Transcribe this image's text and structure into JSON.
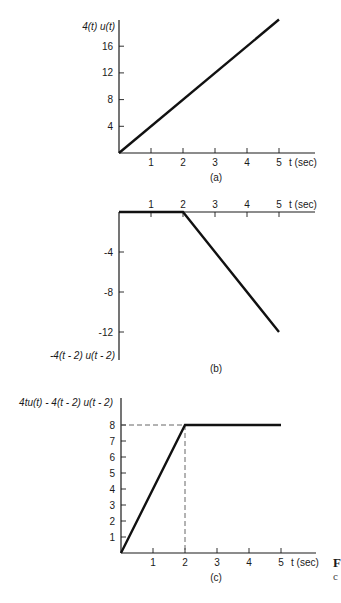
{
  "chart_data": [
    {
      "type": "line",
      "caption": "(a)",
      "ylabel": "4(t) u(t)",
      "xlabel": "t (sec)",
      "x_ticks": [
        "1",
        "2",
        "3",
        "4",
        "5"
      ],
      "y_ticks": [
        "4",
        "8",
        "12",
        "16"
      ],
      "y_tick_values": [
        4,
        8,
        12,
        16
      ],
      "xlim": [
        0,
        5
      ],
      "ylim": [
        0,
        20
      ],
      "series": [
        {
          "name": "4t u(t)",
          "x": [
            0,
            5
          ],
          "y": [
            0,
            20
          ]
        }
      ],
      "grid": false
    },
    {
      "type": "line",
      "caption": "(b)",
      "ylabel": "-4(t - 2) u(t - 2)",
      "xlabel": "t (sec)",
      "x_ticks": [
        "1",
        "2",
        "3",
        "4",
        "5"
      ],
      "y_ticks": [
        "-4",
        "-8",
        "-12"
      ],
      "y_tick_values": [
        -4,
        -8,
        -12
      ],
      "xlim": [
        0,
        5
      ],
      "ylim": [
        -14,
        0
      ],
      "series": [
        {
          "name": "-4(t-2) u(t-2)",
          "x": [
            0,
            2,
            5
          ],
          "y": [
            0,
            0,
            -12
          ]
        }
      ],
      "grid": false
    },
    {
      "type": "line",
      "caption": "(c)",
      "ylabel": "4tu(t) - 4(t - 2) u(t - 2)",
      "xlabel": "t (sec)",
      "x_ticks": [
        "1",
        "2",
        "3",
        "4",
        "5"
      ],
      "y_ticks": [
        "1",
        "2",
        "3",
        "4",
        "5",
        "6",
        "7",
        "8"
      ],
      "y_tick_values": [
        1,
        2,
        3,
        4,
        5,
        6,
        7,
        8
      ],
      "xlim": [
        0,
        5
      ],
      "ylim": [
        0,
        9
      ],
      "series": [
        {
          "name": "4tu(t) - 4(t-2) u(t-2)",
          "x": [
            0,
            2,
            5
          ],
          "y": [
            0,
            8,
            8
          ]
        }
      ],
      "annotations": [
        {
          "type": "dashed-guide",
          "x": 2,
          "y": 8
        }
      ],
      "grid": false
    }
  ],
  "side_text": {
    "line1": "F",
    "line2": "c"
  }
}
